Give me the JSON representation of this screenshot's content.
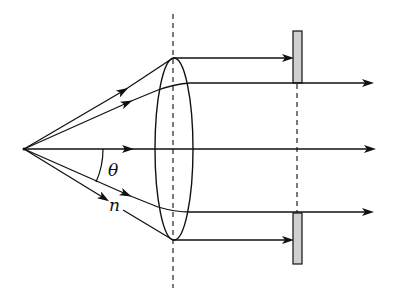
{
  "diagram": {
    "labels": {
      "angle": "θ",
      "ray": "n"
    },
    "colors": {
      "stroke": "#111111",
      "slab_fill": "#d0d0d0",
      "background": "#ffffff"
    },
    "elements": {
      "source": {
        "x": 24,
        "y": 149
      },
      "lens": {
        "cx": 174,
        "top": 58,
        "bottom": 240,
        "half_width": 19
      },
      "lens_axis_dashed": {
        "x": 173,
        "y1": 14,
        "y2": 285
      },
      "slab_axis_dashed": {
        "x": 297,
        "y1": 83,
        "y2": 212
      },
      "slabs": [
        {
          "x": 293,
          "y": 31,
          "w": 9,
          "h": 52
        },
        {
          "x": 293,
          "y": 212,
          "w": 9,
          "h": 52
        }
      ],
      "rays": [
        {
          "name": "top-marginal",
          "exit_y": 58,
          "blocked": true
        },
        {
          "name": "upper",
          "exit_y": 83,
          "blocked": false
        },
        {
          "name": "axis",
          "exit_y": 149,
          "blocked": false
        },
        {
          "name": "lower",
          "exit_y": 212,
          "blocked": false
        },
        {
          "name": "bottom-marginal",
          "exit_y": 240,
          "blocked": true
        }
      ]
    }
  }
}
